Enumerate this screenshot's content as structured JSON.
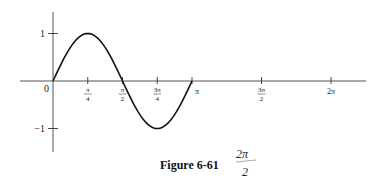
{
  "figure": {
    "caption": "Figure 6-61",
    "handwritten_note": {
      "numerator": "2π",
      "denominator": "2"
    }
  },
  "chart_data": {
    "type": "line",
    "title": "",
    "function": "sin(2x)",
    "xlabel": "",
    "ylabel": "",
    "xlim": [
      0,
      6.2832
    ],
    "ylim": [
      -1,
      1
    ],
    "grid": false,
    "legend": null,
    "x_ticks": [
      {
        "value": 0.7854,
        "label_num": "π",
        "label_den": "4"
      },
      {
        "value": 1.5708,
        "label_num": "π",
        "label_den": "2"
      },
      {
        "value": 2.3562,
        "label_num": "3π",
        "label_den": "4"
      },
      {
        "value": 3.1416,
        "label_num": "π",
        "label_den": ""
      },
      {
        "value": 4.7124,
        "label_num": "3π",
        "label_den": "2"
      },
      {
        "value": 6.2832,
        "label_num": "2π",
        "label_den": ""
      }
    ],
    "y_ticks": [
      {
        "value": 1,
        "label": "1"
      },
      {
        "value": -1,
        "label": "−1"
      }
    ],
    "origin_label": "0",
    "series": [
      {
        "name": "y = sin 2x",
        "x": [
          0,
          0.3927,
          0.7854,
          1.1781,
          1.5708,
          1.9635,
          2.3562,
          2.7489,
          3.1416
        ],
        "y": [
          0,
          0.7071,
          1,
          0.7071,
          0,
          -0.7071,
          -1,
          -0.7071,
          0
        ]
      }
    ]
  }
}
